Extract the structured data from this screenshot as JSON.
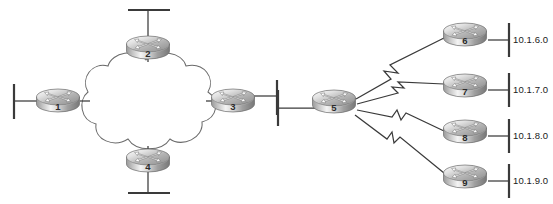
{
  "diagram": {
    "type": "network-topology",
    "colors": {
      "line": "#3a3a3a",
      "cloud_stroke": "#6a6a6a",
      "background": "#ffffff",
      "router_top_light": "#f2f2f2",
      "router_top_dark": "#8d8d8d",
      "router_body_light": "#fafafa",
      "router_body_dark": "#707070",
      "label_text": "#1a1a1a"
    }
  },
  "cloud": {
    "name": "wan-cloud",
    "label": ""
  },
  "routers": [
    {
      "id": "r1",
      "label": "1",
      "x": 58,
      "y": 100,
      "scale": 1.0
    },
    {
      "id": "r2",
      "label": "2",
      "x": 148,
      "y": 47,
      "scale": 1.0
    },
    {
      "id": "r3",
      "label": "3",
      "x": 233,
      "y": 100,
      "scale": 1.0
    },
    {
      "id": "r4",
      "label": "4",
      "x": 148,
      "y": 160,
      "scale": 1.0
    },
    {
      "id": "r5",
      "label": "5",
      "x": 334,
      "y": 101,
      "scale": 1.0
    },
    {
      "id": "r6",
      "label": "6",
      "x": 465,
      "y": 34,
      "scale": 1.0
    },
    {
      "id": "r7",
      "label": "7",
      "x": 465,
      "y": 85,
      "scale": 1.0
    },
    {
      "id": "r8",
      "label": "8",
      "x": 465,
      "y": 131,
      "scale": 1.0
    },
    {
      "id": "r9",
      "label": "9",
      "x": 465,
      "y": 176,
      "scale": 1.0
    }
  ],
  "network_labels": [
    {
      "id": "net6",
      "text": "10.1.6.0",
      "router": "6"
    },
    {
      "id": "net7",
      "text": "10.1.7.0",
      "router": "7"
    },
    {
      "id": "net8",
      "text": "10.1.8.0",
      "router": "8"
    },
    {
      "id": "net9",
      "text": "10.1.9.0",
      "router": "9"
    }
  ],
  "lan_segments": [
    {
      "id": "lan-r1",
      "router": "1",
      "side": "left",
      "label": ""
    },
    {
      "id": "lan-r2",
      "router": "2",
      "side": "top",
      "label": ""
    },
    {
      "id": "lan-r3",
      "router": "3",
      "side": "right",
      "label": ""
    },
    {
      "id": "lan-r4",
      "router": "4",
      "side": "bottom",
      "label": ""
    },
    {
      "id": "lan-r5",
      "router": "5",
      "side": "left",
      "label": ""
    }
  ],
  "serial_links": [
    {
      "id": "link-5-6",
      "from": "5",
      "to": "6",
      "style": "lightning"
    },
    {
      "id": "link-5-7",
      "from": "5",
      "to": "7",
      "style": "lightning"
    },
    {
      "id": "link-5-8",
      "from": "5",
      "to": "8",
      "style": "lightning"
    },
    {
      "id": "link-5-9",
      "from": "5",
      "to": "9",
      "style": "lightning"
    }
  ],
  "cloud_links": [
    {
      "id": "link-1-cloud",
      "from": "1",
      "to": "cloud"
    },
    {
      "id": "link-2-cloud",
      "from": "2",
      "to": "cloud"
    },
    {
      "id": "link-3-cloud",
      "from": "3",
      "to": "cloud"
    },
    {
      "id": "link-4-cloud",
      "from": "4",
      "to": "cloud"
    }
  ]
}
